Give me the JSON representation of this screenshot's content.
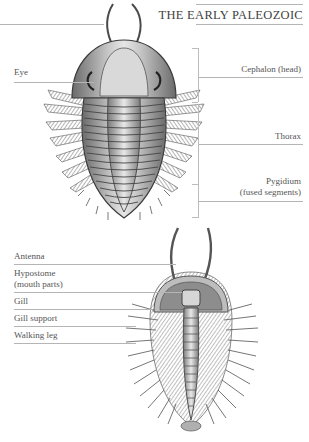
{
  "header": {
    "title": "THE EARLY PALEOZOIC"
  },
  "dorsal_view": {
    "left_labels": [
      {
        "id": "eye",
        "text": "Eye"
      }
    ],
    "right_labels": [
      {
        "id": "cephalon",
        "line1": "Cephalon (head)",
        "line2": ""
      },
      {
        "id": "thorax",
        "line1": "Thorax",
        "line2": ""
      },
      {
        "id": "pygidium",
        "line1": "Pygidium",
        "line2": "(fused segments)"
      }
    ]
  },
  "ventral_view": {
    "left_labels": [
      {
        "id": "antenna",
        "line1": "Antenna",
        "line2": ""
      },
      {
        "id": "hypostome",
        "line1": "Hypostome",
        "line2": "(mouth parts)"
      },
      {
        "id": "gill",
        "line1": "Gill",
        "line2": ""
      },
      {
        "id": "gill-support",
        "line1": "Gill support",
        "line2": ""
      },
      {
        "id": "walking-leg",
        "line1": "Walking leg",
        "line2": ""
      }
    ]
  },
  "colors": {
    "rule": "#b5b5b5",
    "text": "#555555",
    "title": "#3f3f3f",
    "illustration_dark": "#3a3a3a",
    "illustration_mid": "#8a8a8a",
    "illustration_light": "#d2d2d2"
  }
}
